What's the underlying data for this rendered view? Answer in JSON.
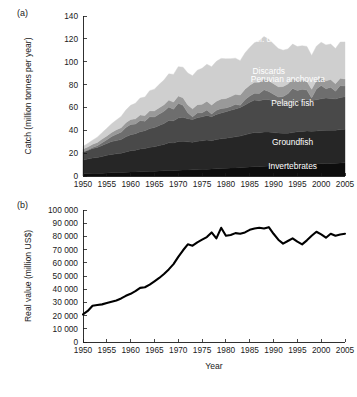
{
  "figure": {
    "panel_a_tag": "(a)",
    "panel_b_tag": "(b)"
  },
  "chart_data": [
    {
      "type": "area",
      "panel": "(a)",
      "title": "",
      "xlabel": "",
      "ylabel": "Catch (million tonnes per year)",
      "xlim": [
        1950,
        2005
      ],
      "ylim": [
        0,
        140
      ],
      "ytick_labels": [
        "0",
        "20",
        "40",
        "60",
        "80",
        "100",
        "120",
        "140"
      ],
      "yticks": [
        0,
        20,
        40,
        60,
        80,
        100,
        120,
        140
      ],
      "xtick_labels": [
        "1950",
        "1955",
        "1960",
        "1965",
        "1970",
        "1975",
        "1980",
        "1985",
        "1990",
        "1995",
        "2000",
        "2005"
      ],
      "xticks": [
        1950,
        1955,
        1960,
        1965,
        1970,
        1975,
        1980,
        1985,
        1990,
        1995,
        2000,
        2005
      ],
      "grid": false,
      "stacked": true,
      "legend_position": "inline-annotations",
      "x": [
        1950,
        1951,
        1952,
        1953,
        1954,
        1955,
        1956,
        1957,
        1958,
        1959,
        1960,
        1961,
        1962,
        1963,
        1964,
        1965,
        1966,
        1967,
        1968,
        1969,
        1970,
        1971,
        1972,
        1973,
        1974,
        1975,
        1976,
        1977,
        1978,
        1979,
        1980,
        1981,
        1982,
        1983,
        1984,
        1985,
        1986,
        1987,
        1988,
        1989,
        1990,
        1991,
        1992,
        1993,
        1994,
        1995,
        1996,
        1997,
        1998,
        1999,
        2000,
        2001,
        2002,
        2003,
        2004,
        2005
      ],
      "series": [
        {
          "name": "Invertebrates",
          "color": "#0d0d0d",
          "label_color": "#ffffff",
          "values": [
            2.0,
            2.2,
            2.3,
            2.4,
            2.5,
            2.7,
            2.9,
            3.0,
            3.1,
            3.3,
            3.5,
            3.6,
            3.8,
            3.9,
            4.1,
            4.2,
            4.4,
            4.6,
            4.8,
            4.9,
            5.1,
            5.2,
            5.3,
            5.4,
            5.6,
            5.8,
            6.0,
            6.1,
            6.3,
            6.5,
            6.7,
            6.9,
            7.1,
            7.3,
            7.6,
            7.9,
            8.2,
            8.4,
            8.6,
            8.8,
            9.0,
            9.1,
            9.3,
            9.5,
            9.8,
            10.1,
            10.2,
            10.4,
            10.5,
            10.6,
            10.8,
            10.9,
            11.0,
            11.2,
            11.4,
            11.5
          ]
        },
        {
          "name": "Groundfish",
          "color": "#262626",
          "label_color": "#ffffff",
          "values": [
            12.0,
            12.6,
            13.4,
            13.8,
            14.6,
            15.4,
            16.0,
            16.4,
            16.8,
            17.8,
            18.6,
            19.0,
            19.8,
            20.2,
            21.0,
            21.4,
            22.2,
            23.0,
            24.2,
            24.0,
            25.0,
            25.2,
            24.6,
            24.2,
            24.8,
            25.0,
            25.4,
            24.8,
            25.6,
            26.0,
            26.4,
            26.8,
            27.2,
            27.6,
            28.4,
            29.2,
            29.8,
            29.4,
            29.8,
            29.6,
            29.0,
            28.6,
            28.0,
            27.8,
            28.2,
            28.6,
            28.8,
            29.0,
            28.6,
            28.8,
            29.0,
            29.2,
            29.0,
            28.8,
            29.2,
            29.4
          ]
        },
        {
          "name": "Pelagic fish",
          "color": "#494949",
          "label_color": "#ffffff",
          "values": [
            7.0,
            7.6,
            8.4,
            8.8,
            9.6,
            10.4,
            11.2,
            11.6,
            12.0,
            13.2,
            14.0,
            14.4,
            15.2,
            15.6,
            16.4,
            16.8,
            17.6,
            18.4,
            19.6,
            19.4,
            20.6,
            21.0,
            20.2,
            19.8,
            20.6,
            21.0,
            21.6,
            21.0,
            22.0,
            22.6,
            23.2,
            23.8,
            24.4,
            25.0,
            26.2,
            27.4,
            28.4,
            28.0,
            28.6,
            28.4,
            27.6,
            27.0,
            26.2,
            26.0,
            26.6,
            27.2,
            27.4,
            27.8,
            27.0,
            27.4,
            27.8,
            28.2,
            27.8,
            27.4,
            28.0,
            28.4
          ]
        },
        {
          "name": "Peruvian anchoveta",
          "color": "#6e6e6e",
          "label_color": "#ffffff",
          "values": [
            0.2,
            0.4,
            0.8,
            1.4,
            2.4,
            3.2,
            4.4,
            5.6,
            6.4,
            8.2,
            9.0,
            8.4,
            9.8,
            8.2,
            10.4,
            9.2,
            10.0,
            10.6,
            11.8,
            10.2,
            13.0,
            10.4,
            5.2,
            2.4,
            4.2,
            3.6,
            4.8,
            2.4,
            3.6,
            4.0,
            3.2,
            3.4,
            4.0,
            2.0,
            4.6,
            5.6,
            6.0,
            6.4,
            8.4,
            7.2,
            6.0,
            4.4,
            6.0,
            8.6,
            12.0,
            9.0,
            9.6,
            8.0,
            2.2,
            9.4,
            11.6,
            8.0,
            9.8,
            6.8,
            10.6,
            9.4
          ]
        },
        {
          "name": "Discards",
          "color": "#999999",
          "label_color": "#ffffff",
          "values": [
            2.4,
            2.6,
            2.8,
            3.0,
            3.2,
            3.4,
            3.6,
            3.8,
            4.0,
            4.2,
            4.4,
            4.6,
            4.8,
            5.0,
            5.2,
            5.4,
            5.6,
            5.8,
            6.0,
            6.2,
            6.4,
            6.6,
            6.8,
            7.0,
            7.2,
            7.4,
            7.6,
            7.8,
            8.0,
            8.2,
            8.4,
            8.6,
            8.8,
            9.0,
            9.2,
            9.4,
            9.6,
            9.8,
            9.6,
            9.4,
            9.2,
            9.0,
            8.8,
            8.6,
            8.4,
            8.2,
            8.0,
            7.8,
            7.6,
            7.4,
            7.2,
            7.0,
            6.8,
            6.6,
            6.4,
            6.2
          ]
        },
        {
          "name": "IUU (excl. discards)",
          "color": "#cfcfcf",
          "label_color": "#1a1a1a",
          "values": [
            2.4,
            3.0,
            3.6,
            4.6,
            5.6,
            6.6,
            7.6,
            8.6,
            9.8,
            11.0,
            12.4,
            13.6,
            14.8,
            16.2,
            17.6,
            19.0,
            20.4,
            21.6,
            23.0,
            24.2,
            25.6,
            26.8,
            28.0,
            29.0,
            30.2,
            31.4,
            32.4,
            33.6,
            34.8,
            35.6,
            34.6,
            33.2,
            31.6,
            30.0,
            31.6,
            33.0,
            34.6,
            36.4,
            37.0,
            36.2,
            34.8,
            33.4,
            31.8,
            30.6,
            30.4,
            30.2,
            30.0,
            30.4,
            29.6,
            30.0,
            30.6,
            31.4,
            31.0,
            30.8,
            31.6,
            32.4
          ]
        }
      ],
      "annotations": [
        {
          "text": "IUU (excl. discards)",
          "x": 1988,
          "y": 117,
          "anchor": "middle",
          "color": "#1a1a1a"
        },
        {
          "text": "Discards",
          "x": 1989,
          "y": 89,
          "anchor": "middle",
          "color": "#ffffff"
        },
        {
          "text": "Peruvian anchoveta",
          "x": 1993,
          "y": 82,
          "anchor": "middle",
          "color": "#ffffff"
        },
        {
          "text": "Pelagic fish",
          "x": 1994,
          "y": 61,
          "anchor": "middle",
          "color": "#ffffff"
        },
        {
          "text": "Groundfish",
          "x": 1994,
          "y": 27,
          "anchor": "middle",
          "color": "#ffffff"
        },
        {
          "text": "Invertebrates",
          "x": 1994,
          "y": 6,
          "anchor": "middle",
          "color": "#ffffff"
        }
      ]
    },
    {
      "type": "line",
      "panel": "(b)",
      "title": "",
      "xlabel": "Year",
      "ylabel": "Real value (million US$)",
      "xlim": [
        1950,
        2005
      ],
      "ylim": [
        0,
        100000
      ],
      "ytick_labels": [
        "0",
        "10 000",
        "20 000",
        "30 000",
        "40 000",
        "50 000",
        "60 000",
        "70 000",
        "80 000",
        "90 000",
        "100 000"
      ],
      "yticks": [
        0,
        10000,
        20000,
        30000,
        40000,
        50000,
        60000,
        70000,
        80000,
        90000,
        100000
      ],
      "xtick_labels": [
        "1950",
        "1955",
        "1960",
        "1965",
        "1970",
        "1975",
        "1980",
        "1985",
        "1990",
        "1995",
        "2000",
        "2005"
      ],
      "xticks": [
        1950,
        1955,
        1960,
        1965,
        1970,
        1975,
        1980,
        1985,
        1990,
        1995,
        2000,
        2005
      ],
      "grid": false,
      "line_color": "#000000",
      "x": [
        1950,
        1951,
        1952,
        1953,
        1954,
        1955,
        1956,
        1957,
        1958,
        1959,
        1960,
        1961,
        1962,
        1963,
        1964,
        1965,
        1966,
        1967,
        1968,
        1969,
        1970,
        1971,
        1972,
        1973,
        1974,
        1975,
        1976,
        1977,
        1978,
        1979,
        1980,
        1981,
        1982,
        1983,
        1984,
        1985,
        1986,
        1987,
        1988,
        1989,
        1990,
        1991,
        1992,
        1993,
        1994,
        1995,
        1996,
        1997,
        1998,
        1999,
        2000,
        2001,
        2002,
        2003,
        2004,
        2005
      ],
      "values": [
        21000,
        23500,
        27500,
        28000,
        28500,
        29500,
        30500,
        31500,
        33000,
        35000,
        36500,
        38500,
        41000,
        41500,
        43500,
        46000,
        48500,
        51500,
        55000,
        59000,
        64500,
        69500,
        74000,
        73000,
        75500,
        77500,
        79500,
        83000,
        78500,
        86500,
        80500,
        81000,
        82500,
        82000,
        83000,
        85000,
        86000,
        86500,
        86000,
        87000,
        82000,
        77500,
        74500,
        76500,
        78500,
        76000,
        74000,
        77000,
        80500,
        83500,
        81500,
        79000,
        82000,
        80500,
        81500,
        82000
      ]
    }
  ]
}
